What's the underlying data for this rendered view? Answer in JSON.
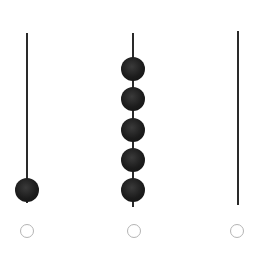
{
  "diagram": {
    "type": "abacus",
    "rod_color": "#2a2a2a",
    "bead_color": "#1c1c1c",
    "selector_color": "#b4b4b4",
    "rods": [
      {
        "index": 0,
        "x": 27,
        "top": 33,
        "bottom": 203,
        "bead_count": 1,
        "bead_centers_y": [
          190
        ],
        "selector": {
          "cx": 27,
          "cy": 231,
          "selected": false
        }
      },
      {
        "index": 1,
        "x": 133,
        "top": 33,
        "bottom": 207,
        "bead_count": 5,
        "bead_centers_y": [
          69,
          99,
          130,
          160,
          190
        ],
        "selector": {
          "cx": 134,
          "cy": 231,
          "selected": false
        }
      },
      {
        "index": 2,
        "x": 238,
        "top": 31,
        "bottom": 205,
        "bead_count": 0,
        "bead_centers_y": [],
        "selector": {
          "cx": 237,
          "cy": 231,
          "selected": false
        }
      }
    ]
  }
}
